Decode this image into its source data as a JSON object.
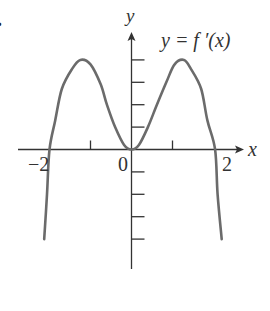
{
  "problem_marker": ".",
  "chart_data": {
    "type": "line",
    "title": "",
    "curve_label": "y = f ′(x)",
    "xlabel": "x",
    "ylabel": "y",
    "x_tick_labels": [
      "−2",
      "0",
      "2"
    ],
    "x_tick_label_values": [
      -2,
      0,
      2
    ],
    "x_ticks": [
      -2,
      -1,
      0,
      1,
      2
    ],
    "y_ticks": [
      -4,
      -3,
      -2,
      -1,
      1,
      2,
      3,
      4
    ],
    "y_tick_labels": [],
    "xlim": [
      -2.75,
      2.7
    ],
    "ylim": [
      -5.3,
      5.2
    ],
    "grid": false,
    "legend": "none",
    "series": [
      {
        "name": "f'(x)",
        "x": [
          -2.13,
          -2.06,
          -2.0,
          -1.86,
          -1.7,
          -1.45,
          -1.25,
          -1.0,
          -0.75,
          -0.6,
          -0.4,
          -0.18,
          0.0,
          0.18,
          0.4,
          0.62,
          0.85,
          1.05,
          1.28,
          1.45,
          1.7,
          1.85,
          2.04,
          2.1,
          2.2
        ],
        "y": [
          -4.0,
          -2.0,
          0.0,
          1.3,
          2.7,
          3.6,
          4.0,
          3.8,
          2.9,
          2.0,
          1.0,
          0.2,
          0.0,
          0.2,
          1.0,
          2.0,
          3.0,
          3.8,
          4.0,
          3.6,
          2.7,
          1.3,
          0.0,
          -2.0,
          -4.0
        ]
      }
    ],
    "color": "#6b6b6b",
    "axis_color": "#333333"
  }
}
